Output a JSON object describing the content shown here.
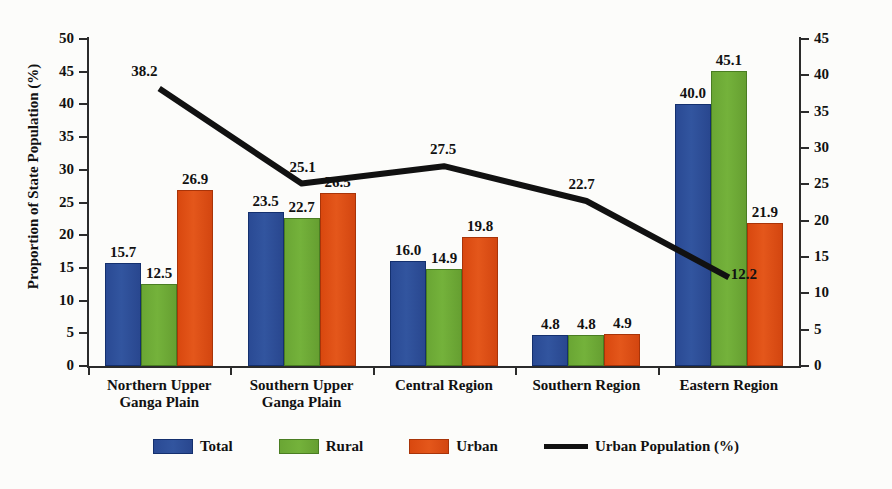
{
  "chart_data": {
    "type": "bar",
    "title": "",
    "subtitle": "",
    "categories": [
      "Northern Upper\nGanga Plain",
      "Southern Upper\nGanga Plain",
      "Central Region",
      "Southern Region",
      "Eastern Region"
    ],
    "series": [
      {
        "name": "Total",
        "type": "bar",
        "axis": "left",
        "color": "#2a4a94",
        "values": [
          15.7,
          23.5,
          16.0,
          4.8,
          40.0
        ],
        "labels": [
          "15.7",
          "23.5",
          "16.0",
          "4.8",
          "40.0"
        ]
      },
      {
        "name": "Rural",
        "type": "bar",
        "axis": "left",
        "color": "#6aa634",
        "values": [
          12.5,
          22.7,
          14.9,
          4.8,
          45.1
        ],
        "labels": [
          "12.5",
          "22.7",
          "14.9",
          "4.8",
          "45.1"
        ]
      },
      {
        "name": "Urban",
        "type": "bar",
        "axis": "left",
        "color": "#d9480f",
        "values": [
          26.9,
          26.5,
          19.8,
          4.9,
          21.9
        ],
        "labels": [
          "26.9",
          "26.5",
          "19.8",
          "4.9",
          "21.9"
        ]
      },
      {
        "name": "Urban Population (%)",
        "type": "line",
        "axis": "right",
        "color": "#111111",
        "values": [
          38.2,
          25.1,
          27.5,
          22.7,
          12.2
        ],
        "labels": [
          "38.2",
          "25.1",
          "27.5",
          "22.7",
          "12.2"
        ]
      }
    ],
    "xlabel": "",
    "ylabel": "Proportion of State Population (%)",
    "y2label": "Urban Population (%)",
    "ylim": [
      0,
      50
    ],
    "y2lim": [
      0,
      45
    ],
    "yticks": [
      0,
      5,
      10,
      15,
      20,
      25,
      30,
      35,
      40,
      45,
      50
    ],
    "y2ticks": [
      0,
      5,
      10,
      15,
      20,
      25,
      30,
      35,
      40,
      45
    ],
    "ytick_labels": [
      "0",
      "5",
      "10",
      "15",
      "20",
      "25",
      "30",
      "35",
      "40",
      "45",
      "50"
    ],
    "y2tick_labels": [
      "0",
      "5",
      "10",
      "15",
      "20",
      "25",
      "30",
      "35",
      "40",
      "45"
    ],
    "grid": false,
    "legend_position": "bottom",
    "legend": [
      "Total",
      "Rural",
      "Urban",
      "Urban Population (%)"
    ]
  },
  "axes": {
    "left_title": "Proportion of State Population (%)",
    "right_title": "Urban Population (%)"
  }
}
